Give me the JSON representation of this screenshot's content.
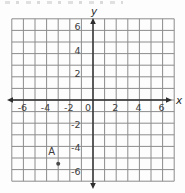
{
  "chart_data": {
    "type": "scatter",
    "title": "",
    "xlabel": "x",
    "ylabel": "y",
    "xlim": [
      -7,
      7
    ],
    "ylim": [
      -7,
      7
    ],
    "grid": true,
    "x_ticks": [
      -6,
      -4,
      -2,
      0,
      2,
      4,
      6
    ],
    "y_ticks": [
      -6,
      -4,
      -2,
      2,
      4,
      6
    ],
    "points": [
      {
        "label": "A",
        "x": -3,
        "y": -5.5
      }
    ]
  },
  "style": {
    "background": "#fdfdfd",
    "grid_color": "#8c8c8c",
    "axis_color": "#2e2e2e",
    "tick_color": "#3d3d3d",
    "point_color": "#4a4a4a",
    "point_label_color": "#8d8d8d"
  }
}
